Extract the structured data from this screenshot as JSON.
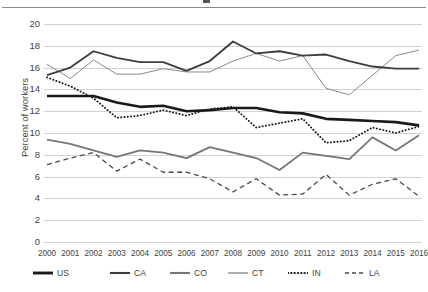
{
  "chart_data": {
    "type": "line",
    "title": "",
    "xlabel": "",
    "ylabel": "Percent of workers",
    "ylim": [
      0,
      20
    ],
    "yticks": [
      0,
      2,
      4,
      6,
      8,
      10,
      12,
      14,
      16,
      18,
      20
    ],
    "grid": true,
    "legend_position": "bottom",
    "x": [
      2000,
      2001,
      2002,
      2003,
      2004,
      2005,
      2006,
      2007,
      2008,
      2009,
      2010,
      2011,
      2012,
      2013,
      2014,
      2015,
      2016
    ],
    "categories": [
      "2000",
      "2001",
      "2002",
      "2003",
      "2004",
      "2005",
      "2006",
      "2007",
      "2008",
      "2009",
      "2010",
      "2011",
      "2012",
      "2013",
      "2014",
      "2015",
      "2016"
    ],
    "series": [
      {
        "name": "US",
        "style": "solid-thick",
        "color": "#1a1a1a",
        "values": [
          13.4,
          13.4,
          13.4,
          12.8,
          12.4,
          12.5,
          12.0,
          12.1,
          12.3,
          12.3,
          11.9,
          11.8,
          11.3,
          11.2,
          11.1,
          11.0,
          10.7
        ]
      },
      {
        "name": "CA",
        "style": "solid-medium",
        "color": "#3d3d3d",
        "values": [
          15.3,
          16.0,
          17.5,
          16.9,
          16.5,
          16.5,
          15.7,
          16.6,
          18.4,
          17.3,
          17.5,
          17.1,
          17.2,
          16.6,
          16.1,
          15.9,
          15.9
        ]
      },
      {
        "name": "CO",
        "style": "solid-medium",
        "color": "#767676",
        "values": [
          9.4,
          9.0,
          8.4,
          7.8,
          8.4,
          8.2,
          7.7,
          8.7,
          8.2,
          7.7,
          6.6,
          8.2,
          7.9,
          7.6,
          9.6,
          8.4,
          9.8
        ]
      },
      {
        "name": "CT",
        "style": "solid-thin",
        "color": "#8a8a8a",
        "values": [
          16.3,
          15.0,
          16.7,
          15.4,
          15.4,
          15.9,
          15.6,
          15.6,
          16.6,
          17.3,
          16.6,
          17.1,
          14.1,
          13.5,
          15.3,
          17.1,
          17.6
        ]
      },
      {
        "name": "IN",
        "style": "dotted",
        "color": "#1a1a1a",
        "values": [
          15.1,
          14.3,
          13.2,
          11.4,
          11.6,
          12.1,
          11.6,
          12.2,
          12.4,
          10.5,
          10.9,
          11.3,
          9.1,
          9.3,
          10.5,
          10.0,
          10.6
        ]
      },
      {
        "name": "LA",
        "style": "dashed",
        "color": "#4a4a4a",
        "values": [
          7.1,
          7.7,
          8.2,
          6.5,
          7.6,
          6.4,
          6.4,
          5.8,
          4.6,
          5.8,
          4.3,
          4.4,
          6.2,
          4.3,
          5.3,
          5.8,
          4.2
        ]
      }
    ]
  },
  "legend": {
    "items": [
      {
        "label": "US"
      },
      {
        "label": "CA"
      },
      {
        "label": "CO"
      },
      {
        "label": "CT"
      },
      {
        "label": "IN"
      },
      {
        "label": "LA"
      }
    ]
  },
  "axis": {
    "y_title": "Percent of workers"
  }
}
